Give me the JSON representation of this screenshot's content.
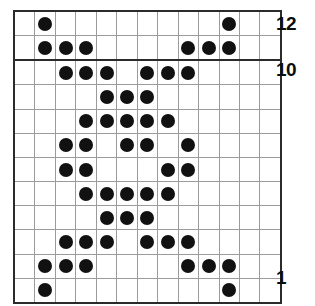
{
  "chart_data": {
    "type": "heatmap",
    "title": "",
    "subtitle": "",
    "xlabel": "",
    "ylabel": "",
    "grid": true,
    "legend_position": "none",
    "columns": 13,
    "rows": 12,
    "symbols": {
      "filled": "●",
      "empty": ""
    },
    "bold_gridlines": {
      "after_column": 2,
      "after_row_from_top": 2
    },
    "row_numbers_shown": [
      12,
      10,
      1
    ],
    "row_label_side": "right",
    "x": [
      1,
      2,
      3,
      4,
      5,
      6,
      7,
      8,
      9,
      10,
      11,
      12,
      13
    ],
    "y": [
      12,
      11,
      10,
      9,
      8,
      7,
      6,
      5,
      4,
      3,
      2,
      1
    ],
    "rows_top_to_bottom": [
      {
        "row": 12,
        "filled_columns": [
          2,
          11
        ],
        "cells": [
          0,
          1,
          0,
          0,
          0,
          0,
          0,
          0,
          0,
          0,
          1,
          0,
          0
        ]
      },
      {
        "row": 11,
        "filled_columns": [
          2,
          3,
          4,
          9,
          10,
          11
        ],
        "cells": [
          0,
          1,
          1,
          1,
          0,
          0,
          0,
          0,
          1,
          1,
          1,
          0,
          0
        ]
      },
      {
        "row": 10,
        "filled_columns": [
          3,
          4,
          5,
          7,
          8,
          9
        ],
        "cells": [
          0,
          0,
          1,
          1,
          1,
          0,
          1,
          1,
          1,
          0,
          0,
          0,
          0
        ]
      },
      {
        "row": 9,
        "filled_columns": [
          5,
          6,
          7
        ],
        "cells": [
          0,
          0,
          0,
          0,
          1,
          1,
          1,
          0,
          0,
          0,
          0,
          0,
          0
        ]
      },
      {
        "row": 8,
        "filled_columns": [
          4,
          5,
          6,
          7,
          8
        ],
        "cells": [
          0,
          0,
          0,
          1,
          1,
          1,
          1,
          1,
          0,
          0,
          0,
          0,
          0
        ]
      },
      {
        "row": 7,
        "filled_columns": [
          3,
          4,
          6,
          7,
          9
        ],
        "cells": [
          0,
          0,
          1,
          1,
          0,
          1,
          1,
          0,
          1,
          0,
          0,
          0,
          0
        ]
      },
      {
        "row": 6,
        "filled_columns": [
          3,
          4,
          8,
          9
        ],
        "cells": [
          0,
          0,
          1,
          1,
          0,
          0,
          0,
          1,
          1,
          0,
          0,
          0,
          0
        ]
      },
      {
        "row": 5,
        "filled_columns": [
          4,
          5,
          6,
          7,
          8
        ],
        "cells": [
          0,
          0,
          0,
          1,
          1,
          1,
          1,
          1,
          0,
          0,
          0,
          0,
          0
        ]
      },
      {
        "row": 4,
        "filled_columns": [
          5,
          6,
          7
        ],
        "cells": [
          0,
          0,
          0,
          0,
          1,
          1,
          1,
          0,
          0,
          0,
          0,
          0,
          0
        ]
      },
      {
        "row": 3,
        "filled_columns": [
          3,
          4,
          5,
          7,
          8,
          9
        ],
        "cells": [
          0,
          0,
          1,
          1,
          1,
          0,
          1,
          1,
          1,
          0,
          0,
          0,
          0
        ]
      },
      {
        "row": 2,
        "filled_columns": [
          2,
          3,
          4,
          9,
          10,
          11
        ],
        "cells": [
          0,
          1,
          1,
          1,
          0,
          0,
          0,
          0,
          1,
          1,
          1,
          0,
          0
        ]
      },
      {
        "row": 1,
        "filled_columns": [
          2,
          11
        ],
        "cells": [
          0,
          1,
          0,
          0,
          0,
          0,
          0,
          0,
          0,
          0,
          1,
          0,
          0
        ]
      }
    ],
    "colors": {
      "filled": "#111111",
      "empty": "#ffffff",
      "gridline": "#9b9b9b",
      "bold_gridline": "#2b2b2b",
      "label": "#0d0d0d"
    }
  },
  "labels": {
    "top_row": "12",
    "mid_row": "10",
    "bottom_row": "1"
  }
}
